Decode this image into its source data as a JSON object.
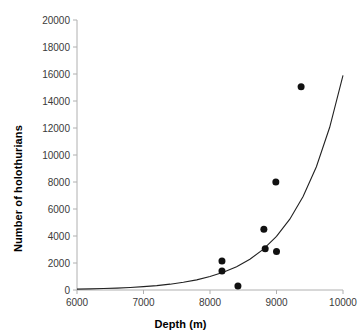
{
  "chart_data": {
    "type": "scatter",
    "title": "",
    "xlabel": "Depth (m)",
    "ylabel": "Number of holothurians",
    "xlim": [
      6000,
      10000
    ],
    "ylim": [
      0,
      20000
    ],
    "xticks": [
      6000,
      7000,
      8000,
      9000,
      10000
    ],
    "yticks": [
      0,
      2000,
      4000,
      6000,
      8000,
      10000,
      12000,
      14000,
      16000,
      18000,
      20000
    ],
    "xtick_labels": [
      "6000",
      "7000",
      "8000",
      "9000",
      "10000"
    ],
    "ytick_labels": [
      "0",
      "2000",
      "4000",
      "6000",
      "8000",
      "10000",
      "12000",
      "14000",
      "16000",
      "18000",
      "20000"
    ],
    "grid": false,
    "legend": "none",
    "marker": {
      "shape": "circle",
      "color": "#111111",
      "size": 7
    },
    "points": [
      {
        "x": 8180,
        "y": 2150
      },
      {
        "x": 8180,
        "y": 1400
      },
      {
        "x": 8420,
        "y": 300
      },
      {
        "x": 8990,
        "y": 8000
      },
      {
        "x": 8810,
        "y": 4500
      },
      {
        "x": 8830,
        "y": 3050
      },
      {
        "x": 9000,
        "y": 2850
      },
      {
        "x": 9370,
        "y": 15050
      }
    ],
    "series": [
      {
        "name": "Exponential fit",
        "type": "line",
        "color": "#222222",
        "x": [
          6000,
          6200,
          6400,
          6600,
          6800,
          7000,
          7200,
          7400,
          7600,
          7800,
          8000,
          8200,
          8400,
          8600,
          8800,
          9000,
          9200,
          9400,
          9600,
          9800,
          10000
        ],
        "y": [
          62,
          82,
          108,
          142,
          188,
          248,
          327,
          432,
          570,
          752,
          993,
          1310,
          1729,
          2282,
          3011,
          3974,
          5244,
          6920,
          9133,
          12053,
          15906
        ]
      }
    ]
  },
  "axes": {
    "x_title": "Depth (m)",
    "y_title": "Number of holothurians"
  }
}
